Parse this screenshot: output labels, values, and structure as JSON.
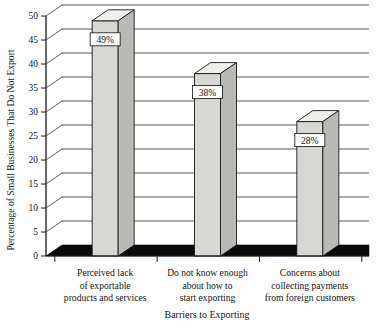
{
  "chart_data": {
    "type": "bar",
    "title": "",
    "xlabel": "Barriers to Exporting",
    "ylabel": "Percentage of Small Businesses That Do Not Export",
    "categories": [
      "Perceived lack of exportable products and services",
      "Do not know enough about how to start exporting",
      "Concerns about collecting payments from foreign customers"
    ],
    "category_lines": [
      [
        "Perceived lack",
        "of exportable",
        "products and services"
      ],
      [
        "Do not know enough",
        "about how to",
        "start exporting"
      ],
      [
        "Concerns about",
        "collecting payments",
        "from foreign customers"
      ]
    ],
    "values": [
      49,
      38,
      28
    ],
    "data_labels": [
      "49%",
      "38%",
      "28%"
    ],
    "ylim": [
      0,
      50
    ],
    "ytick_step": 5,
    "yticks": [
      0,
      5,
      10,
      15,
      20,
      25,
      30,
      35,
      40,
      45,
      50
    ],
    "ytick_labels": [
      "0",
      "5",
      "10",
      "15",
      "20",
      "25",
      "30",
      "35",
      "40",
      "45",
      "50"
    ],
    "grid": true,
    "legend": "none",
    "style": "3d-column",
    "colors": {
      "bar_front": "#d7d7d4",
      "bar_top": "#efefec",
      "bar_side": "#b9b9b5",
      "bar_outline": "#1a1a1a",
      "floor": "#0a0a0a",
      "gridline": "#4a4a4a",
      "axis": "#1a1a1a",
      "background": "#ffffff",
      "label_box": "#ffffff",
      "text": "#151515"
    }
  }
}
